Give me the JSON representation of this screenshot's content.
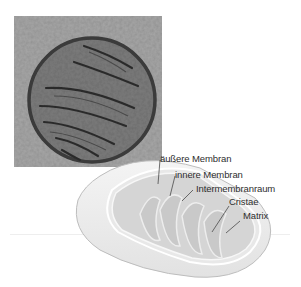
{
  "figure": {
    "photo_description": "Electron micrograph of a mitochondrion",
    "labels": [
      {
        "id": "outer-membrane",
        "text": "äußere Membran"
      },
      {
        "id": "inner-membrane",
        "text": "innere Membran"
      },
      {
        "id": "intermembrane-space",
        "text": "Intermembranraum"
      },
      {
        "id": "cristae",
        "text": "Cristae"
      },
      {
        "id": "matrix",
        "text": "Matrix"
      }
    ]
  }
}
